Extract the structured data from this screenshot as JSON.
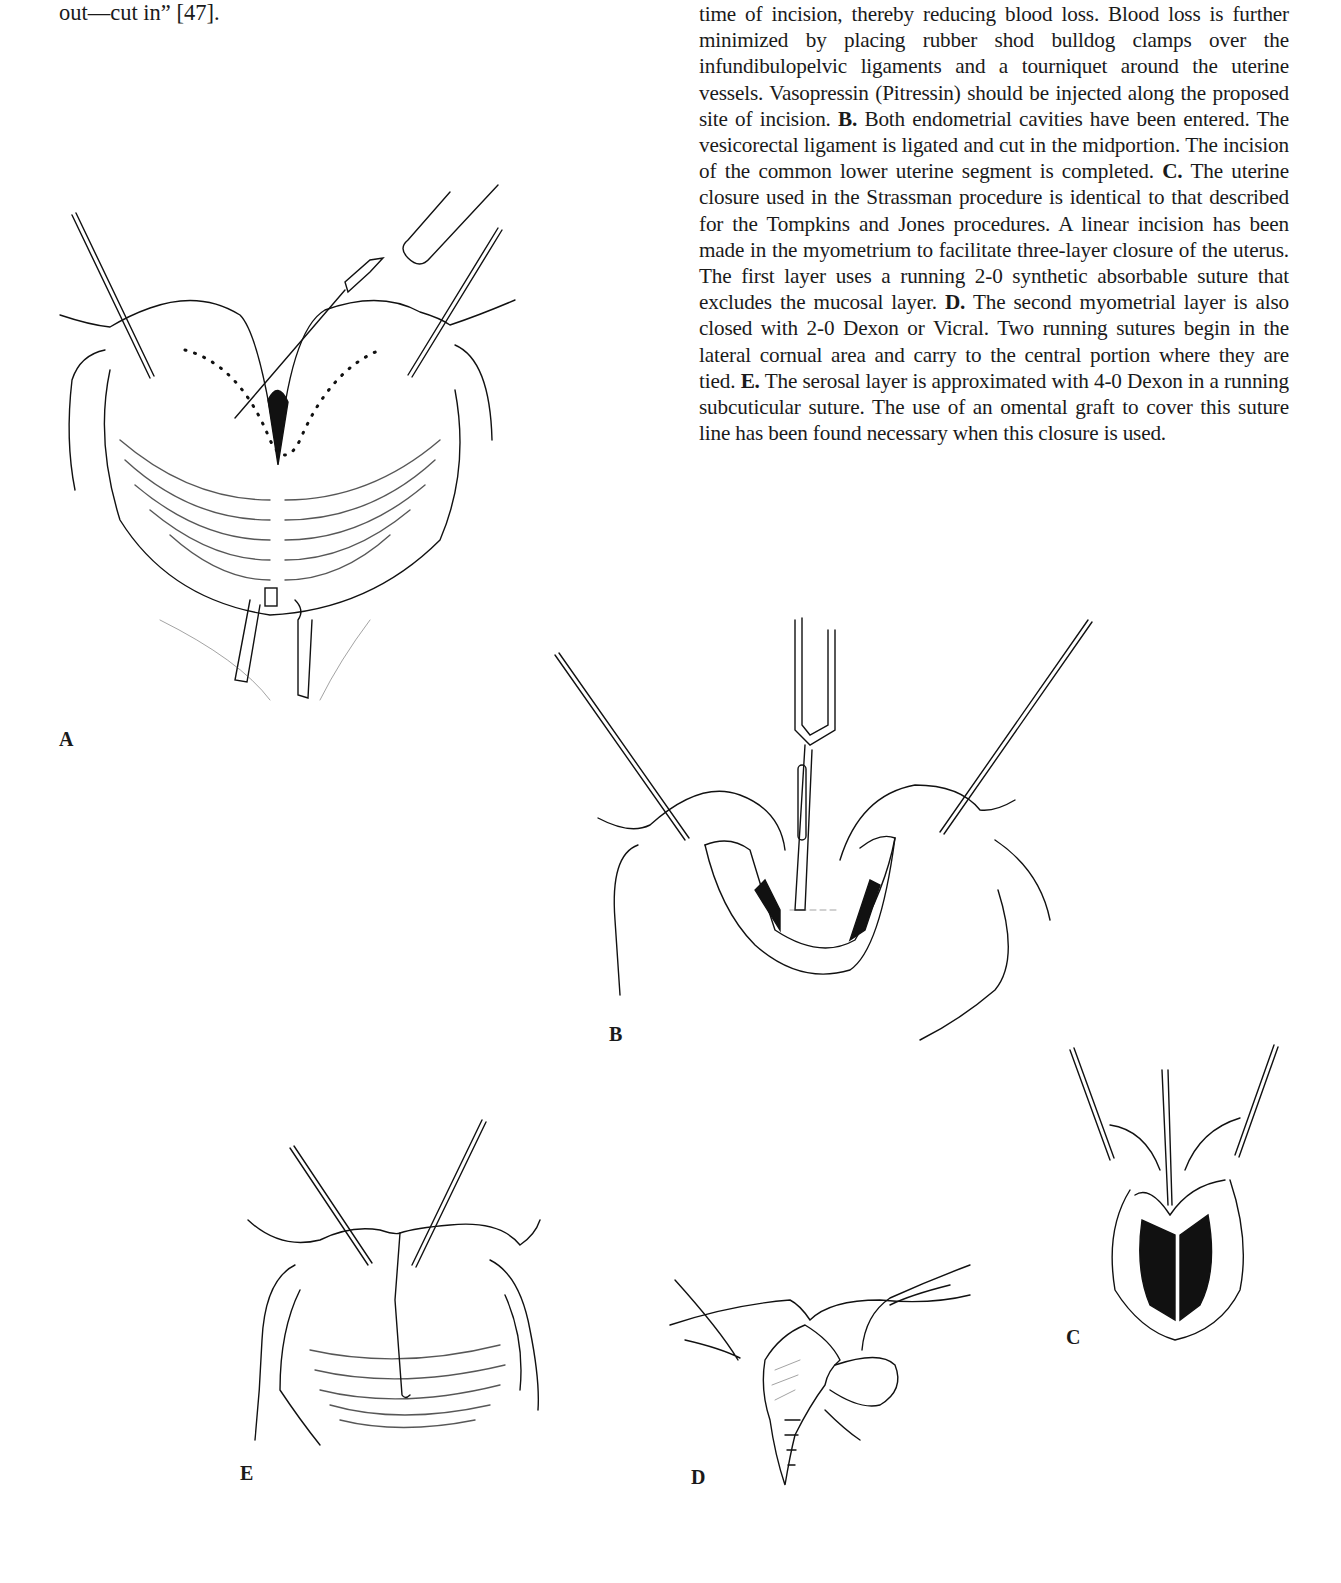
{
  "left_column": {
    "fragment": "out—cut in” [47]."
  },
  "caption": {
    "intro": "time of incision, thereby reducing blood loss. Blood loss is further minimized by placing rubber shod bulldog clamps over the infundibulopelvic ligaments and a tourniquet around the uterine vessels. Vasopressin (Pitressin) should be injected along the proposed site of incision. ",
    "b_label": "B.",
    "b_text": " Both endometrial cavities have been entered. The vesicorectal ligament is ligated and cut in the midportion. The incision of the common lower uterine segment is completed. ",
    "c_label": "C.",
    "c_text": " The uterine closure used in the Strassman procedure is identical to that described for the Tompkins and Jones procedures. A linear incision has been made in the myometrium to facilitate three-layer closure of the uterus. The first layer uses a running 2-0 synthetic absorbable suture that excludes the mucosal layer. ",
    "d_label": "D.",
    "d_text": " The second myometrial layer is also closed with 2-0 Dexon or Vicral. Two running sutures begin in the lateral cornual area and carry to the central portion where they are tied. ",
    "e_label": "E.",
    "e_text": " The serosal layer is approximated with 4-0 Dexon in a running subcuticular suture. The use of an omental graft to cover this suture line has been found necessary when this closure is used."
  },
  "figures": {
    "a": {
      "label": "A"
    },
    "b": {
      "label": "B"
    },
    "c": {
      "label": "C"
    },
    "d": {
      "label": "D"
    },
    "e": {
      "label": "E"
    }
  }
}
